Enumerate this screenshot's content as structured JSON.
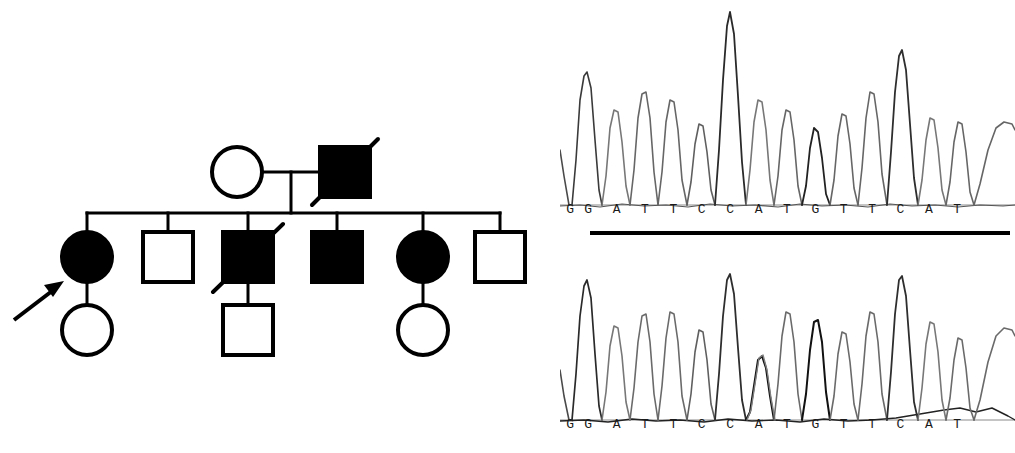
{
  "figure": {
    "background_color": "#ffffff",
    "ink_color": "#000000"
  },
  "pedigree": {
    "name": "family-pedigree",
    "legend": {
      "filled_meaning": "affected",
      "open_meaning": "unaffected",
      "slash_meaning": "deceased",
      "arrow_meaning": "proband"
    },
    "generations": [
      {
        "id": "I",
        "label": "I",
        "members": [
          {
            "id": "I-1",
            "sex": "female",
            "shape": "circle",
            "affected": false,
            "deceased": false,
            "proband": false,
            "cx": 237,
            "cy": 172,
            "r": 25
          },
          {
            "id": "I-2",
            "sex": "male",
            "shape": "square",
            "affected": true,
            "deceased": true,
            "proband": false,
            "cx": 345,
            "cy": 172,
            "size": 50
          }
        ]
      },
      {
        "id": "II",
        "label": "II",
        "members": [
          {
            "id": "II-1",
            "sex": "female",
            "shape": "circle",
            "affected": true,
            "deceased": false,
            "proband": true,
            "cx": 87,
            "cy": 257,
            "r": 25
          },
          {
            "id": "II-2",
            "sex": "male",
            "shape": "square",
            "affected": false,
            "deceased": false,
            "proband": false,
            "cx": 168,
            "cy": 257,
            "size": 50
          },
          {
            "id": "II-3",
            "sex": "male",
            "shape": "square",
            "affected": true,
            "deceased": true,
            "proband": false,
            "cx": 248,
            "cy": 257,
            "size": 50
          },
          {
            "id": "II-4",
            "sex": "male",
            "shape": "square",
            "affected": true,
            "deceased": false,
            "proband": false,
            "cx": 337,
            "cy": 257,
            "size": 50
          },
          {
            "id": "II-5",
            "sex": "female",
            "shape": "circle",
            "affected": true,
            "deceased": false,
            "proband": false,
            "cx": 423,
            "cy": 257,
            "r": 25
          },
          {
            "id": "II-6",
            "sex": "male",
            "shape": "square",
            "affected": false,
            "deceased": false,
            "proband": false,
            "cx": 500,
            "cy": 257,
            "size": 50
          }
        ]
      },
      {
        "id": "III",
        "label": "III",
        "members": [
          {
            "id": "III-1",
            "sex": "female",
            "shape": "circle",
            "affected": false,
            "deceased": false,
            "proband": false,
            "cx": 87,
            "cy": 330,
            "r": 25,
            "parent": "II-1"
          },
          {
            "id": "III-2",
            "sex": "male",
            "shape": "square",
            "affected": false,
            "deceased": false,
            "proband": false,
            "cx": 248,
            "cy": 330,
            "size": 50,
            "parent": "II-3"
          },
          {
            "id": "III-3",
            "sex": "female",
            "shape": "circle",
            "affected": false,
            "deceased": false,
            "proband": false,
            "cx": 423,
            "cy": 330,
            "r": 25,
            "parent": "II-5"
          }
        ]
      }
    ],
    "connectors": {
      "marriage_line_y": 172,
      "descent_x": 291,
      "sibship_line_y": 213,
      "sibship_x_start": 87,
      "sibship_x_end": 500
    },
    "proband_arrow": {
      "name": "proband-arrow",
      "from_x": 14,
      "from_y": 320,
      "to_x": 62,
      "to_y": 283
    }
  },
  "chromatograms": {
    "name": "sanger-sequencing-traces",
    "panels": [
      {
        "id": "top",
        "label": "wild-type-trace",
        "sequence": "GATTCCATGTTCAT",
        "clipped_leading_base": "G",
        "bases": [
          "G",
          "A",
          "T",
          "T",
          "C",
          "C",
          "A",
          "T",
          "G",
          "T",
          "T",
          "C",
          "A",
          "T"
        ],
        "peak_heights": [
          78,
          52,
          62,
          60,
          42,
          100,
          55,
          50,
          38,
          48,
          60,
          74,
          43,
          40
        ],
        "baseline_y": 205,
        "has_underbar": true,
        "underbar": {
          "x": 590,
          "y": 231,
          "width": 420,
          "height": 4
        },
        "note": "homozygous wild-type, uniform peaks"
      },
      {
        "id": "bottom",
        "label": "mutant-trace",
        "sequence": "GATTCCATGTTCAT",
        "clipped_leading_base": "G",
        "bases": [
          "G",
          "A",
          "T",
          "T",
          "C",
          "C",
          "A",
          "T",
          "G",
          "T",
          "T",
          "C",
          "A",
          "T"
        ],
        "peak_heights": [
          80,
          57,
          62,
          62,
          52,
          88,
          33,
          62,
          56,
          50,
          60,
          85,
          55,
          47
        ],
        "baseline_y": 420,
        "has_underbar": false,
        "variant_position_index": 6,
        "variant_base": "A",
        "note": "reduced A peak at position 7 indicating sequence variant"
      }
    ]
  }
}
